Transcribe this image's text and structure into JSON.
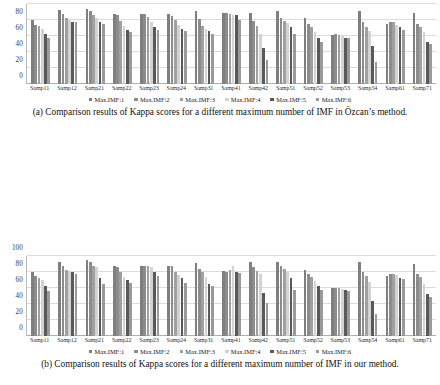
{
  "figure": {
    "panels": [
      "a",
      "b",
      "c"
    ]
  },
  "chart_data": [
    {
      "id": "panel-a",
      "type": "bar",
      "title": "",
      "caption": "(a) Comparison results of Kappa scores for a different maximum number of IMF in Özcan’s method.",
      "xlabel": "",
      "ylabel": "",
      "ylim": [
        0,
        100
      ],
      "yticks": [
        0,
        20,
        40,
        60,
        80,
        100
      ],
      "grid": true,
      "legend_position": "bottom",
      "categories": [
        "Samp11",
        "Samp12",
        "Samp21",
        "Samp22",
        "Samp23",
        "Samp24",
        "Samp31",
        "Samp41",
        "Samp42",
        "Samp51",
        "Samp52",
        "Samp53",
        "Samp54",
        "Samp61",
        "Samp71"
      ],
      "series": [
        {
          "name": "Max.IMF:1",
          "color": "#7f7f7f",
          "values": [
            80,
            92,
            94,
            87,
            87,
            87,
            91,
            89,
            89,
            91,
            82,
            61,
            91,
            75,
            89
          ]
        },
        {
          "name": "Max.IMF:2",
          "color": "#8c8c8c",
          "values": [
            74,
            88,
            91,
            86,
            87,
            85,
            81,
            89,
            79,
            82,
            75,
            62,
            77,
            77,
            75
          ]
        },
        {
          "name": "Max.IMF:3",
          "color": "#a0a0a0",
          "values": [
            72,
            83,
            86,
            79,
            84,
            80,
            73,
            88,
            72,
            79,
            71,
            61,
            71,
            77,
            71
          ]
        },
        {
          "name": "Max.IMF:4",
          "color": "#d3d3d3",
          "values": [
            69,
            80,
            82,
            72,
            78,
            74,
            69,
            86,
            63,
            76,
            65,
            60,
            66,
            74,
            65
          ]
        },
        {
          "name": "Max.IMF:5",
          "color": "#595959",
          "values": [
            62,
            78,
            78,
            68,
            71,
            69,
            66,
            86,
            45,
            71,
            57,
            58,
            48,
            71,
            53
          ]
        },
        {
          "name": "Max.IMF:6",
          "color": "#9a9a9a",
          "values": [
            58,
            77,
            75,
            65,
            67,
            66,
            63,
            80,
            30,
            63,
            52,
            57,
            28,
            68,
            50
          ]
        }
      ]
    },
    {
      "id": "panel-b",
      "type": "bar",
      "title": "",
      "caption": "(b) Comparison results of Kappa scores for a different maximum number of IMF in our method.",
      "xlabel": "",
      "ylabel": "",
      "ylim": [
        0,
        100
      ],
      "yticks": [
        0,
        20,
        40,
        60,
        80,
        100
      ],
      "grid": true,
      "legend_position": "bottom",
      "categories": [
        "Samp11",
        "Samp12",
        "Samp21",
        "Samp22",
        "Samp23",
        "Samp24",
        "Samp31",
        "Samp41",
        "Samp42",
        "Samp51",
        "Samp52",
        "Samp53",
        "Samp54",
        "Samp61",
        "Samp71"
      ],
      "series": [
        {
          "name": "Max.IMF:1",
          "color": "#7f7f7f",
          "values": [
            80,
            92,
            95,
            87,
            87,
            88,
            91,
            81,
            92,
            92,
            83,
            60,
            92,
            75,
            90
          ]
        },
        {
          "name": "Max.IMF:2",
          "color": "#8c8c8c",
          "values": [
            75,
            88,
            92,
            86,
            87,
            87,
            84,
            80,
            86,
            88,
            78,
            60,
            80,
            77,
            77
          ]
        },
        {
          "name": "Max.IMF:3",
          "color": "#a0a0a0",
          "values": [
            73,
            83,
            88,
            80,
            88,
            80,
            80,
            82,
            81,
            84,
            74,
            60,
            75,
            78,
            74
          ]
        },
        {
          "name": "Max.IMF:4",
          "color": "#d3d3d3",
          "values": [
            70,
            81,
            86,
            74,
            86,
            76,
            74,
            88,
            78,
            80,
            69,
            59,
            68,
            76,
            65
          ]
        },
        {
          "name": "Max.IMF:5",
          "color": "#595959",
          "values": [
            62,
            80,
            73,
            70,
            80,
            72,
            65,
            80,
            54,
            73,
            62,
            58,
            44,
            73,
            52
          ]
        },
        {
          "name": "Max.IMF:6",
          "color": "#9a9a9a",
          "values": [
            56,
            78,
            65,
            66,
            75,
            66,
            63,
            79,
            41,
            58,
            58,
            56,
            28,
            71,
            49
          ]
        }
      ]
    },
    {
      "id": "panel-c",
      "type": "bar",
      "title": "",
      "caption": "(c) Mean and standard deviation of Kappa scores",
      "xlabel": "",
      "ylabel": "",
      "ylim": [
        0,
        90
      ],
      "yticks": [
        0,
        20,
        40,
        60,
        80
      ],
      "grid": true,
      "legend_position": "bottom",
      "categories": [
        "Max.IMF:1",
        "Max.IMF:2",
        "Max.IMF:3",
        "Max.IMF:4",
        "Max.IMF:5",
        "Max.IMF:6"
      ],
      "series": [
        {
          "name": "Mean in Özcan’s",
          "color": "#808080",
          "values": [
            86,
            81,
            76,
            70,
            64,
            59
          ]
        },
        {
          "name": "Mean in proposed",
          "color": "#878787",
          "values": [
            86,
            81,
            77,
            71,
            65,
            59
          ]
        },
        {
          "name": "Std in Özcan’s",
          "color": "#8f8f8f",
          "values": [
            7,
            5,
            7,
            9,
            11,
            14
          ]
        },
        {
          "name": "Std in proposed",
          "color": "#c4c4c4",
          "values": [
            7,
            5,
            7,
            9,
            11,
            13
          ]
        }
      ]
    }
  ]
}
